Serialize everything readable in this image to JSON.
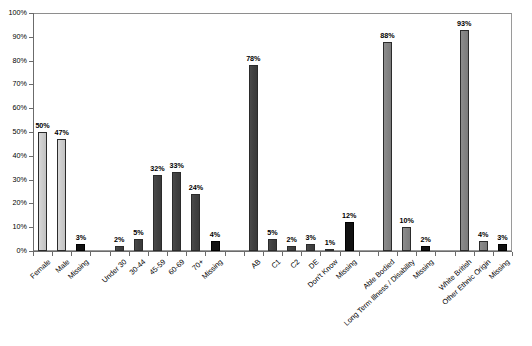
{
  "chart_data": {
    "type": "bar",
    "title": "",
    "subtitle": "",
    "xlabel": "",
    "ylabel": "",
    "ylim": [
      0,
      100
    ],
    "grid": false,
    "legend": "none",
    "y_ticks": [
      "0%",
      "10%",
      "20%",
      "30%",
      "40%",
      "50%",
      "60%",
      "70%",
      "80%",
      "90%",
      "100%"
    ],
    "y_tick_values": [
      0,
      10,
      20,
      30,
      40,
      50,
      60,
      70,
      80,
      90,
      100
    ],
    "categories": [
      "Female",
      "Male",
      "Missing",
      "Under 30",
      "30-44",
      "45-59",
      "60-69",
      "70+",
      "Missing",
      "AB",
      "C1",
      "C2",
      "DE",
      "Don't Know",
      "Missing",
      "Able Bodied",
      "Long Term Illness / Disability",
      "Missing",
      "White British",
      "Other Ethnic Origin",
      "Missing"
    ],
    "values": [
      50,
      47,
      3,
      2,
      5,
      32,
      33,
      24,
      4,
      78,
      5,
      2,
      3,
      1,
      12,
      88,
      10,
      2,
      93,
      4,
      3
    ],
    "value_labels": [
      "50%",
      "47%",
      "3%",
      "2%",
      "5%",
      "32%",
      "33%",
      "24%",
      "4%",
      "78%",
      "5%",
      "2%",
      "3%",
      "1%",
      "12%",
      "88%",
      "10%",
      "2%",
      "93%",
      "4%",
      "3%"
    ],
    "bar_styles": [
      "light",
      "light",
      "black",
      "dark",
      "dark",
      "dark",
      "dark",
      "dark",
      "black",
      "dark",
      "dark",
      "dark",
      "dark",
      "dark",
      "black",
      "mid",
      "mid",
      "black",
      "mid",
      "mid",
      "black"
    ],
    "groups": [
      {
        "name": "Gender",
        "categories": [
          "Female",
          "Male",
          "Missing"
        ]
      },
      {
        "name": "Age",
        "categories": [
          "Under 30",
          "30-44",
          "45-59",
          "60-69",
          "70+",
          "Missing"
        ]
      },
      {
        "name": "Social Grade",
        "categories": [
          "AB",
          "C1",
          "C2",
          "DE",
          "Don't Know",
          "Missing"
        ]
      },
      {
        "name": "Disability",
        "categories": [
          "Able Bodied",
          "Long Term Illness / Disability",
          "Missing"
        ]
      },
      {
        "name": "Ethnicity",
        "categories": [
          "White British",
          "Other Ethnic Origin",
          "Missing"
        ]
      }
    ],
    "colors": {
      "light_bar": "#cdcdcd",
      "dark_bar": "#414141",
      "mid_bar": "#848484",
      "black_bar": "#111111",
      "axis": "#6b6b6b",
      "frame": "#9a9a9a",
      "text": "#000000"
    }
  },
  "footer": {
    "note": ""
  }
}
